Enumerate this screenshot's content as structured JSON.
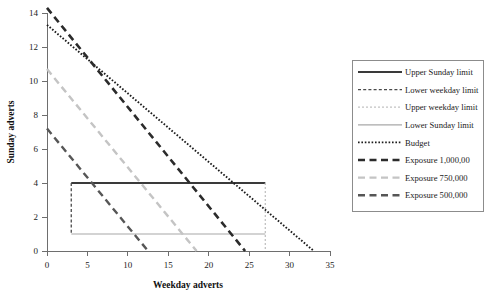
{
  "chart_data": {
    "type": "line",
    "title": "",
    "xlabel": "Weekday adverts",
    "ylabel": "Sunday adverts",
    "xlim": [
      0,
      35
    ],
    "ylim": [
      0,
      14
    ],
    "xticks": [
      0,
      5,
      10,
      15,
      20,
      25,
      30,
      35
    ],
    "yticks": [
      0,
      2,
      4,
      6,
      8,
      10,
      12,
      14
    ],
    "xtick_labels": [
      "0",
      "5",
      "10",
      "15",
      "20",
      "25",
      "30",
      "35"
    ],
    "ytick_labels": [
      "0",
      "2",
      "4",
      "6",
      "8",
      "10",
      "12",
      "14"
    ],
    "grid": false,
    "legend_position": "right",
    "series": [
      {
        "name": "Upper Sunday limit",
        "style": "solid-thick-dark",
        "color": "#3a3a3a",
        "width": 2.2,
        "dash": "none",
        "points": [
          [
            3,
            4
          ],
          [
            27,
            4
          ]
        ]
      },
      {
        "name": "Lower weekday limit",
        "style": "dashed-dark",
        "color": "#4a4a4a",
        "width": 1.3,
        "dash": "3,2.2",
        "points": [
          [
            3,
            4
          ],
          [
            3,
            1
          ]
        ]
      },
      {
        "name": "Upper weekday limit",
        "style": "dotted-light",
        "color": "#c2c2c2",
        "width": 1.3,
        "dash": "2,2",
        "points": [
          [
            27,
            4
          ],
          [
            27,
            0
          ]
        ]
      },
      {
        "name": "Lower Sunday limit",
        "style": "solid-light",
        "color": "#a8a8a8",
        "width": 1.2,
        "dash": "none",
        "points": [
          [
            3,
            1
          ],
          [
            27,
            1
          ]
        ]
      },
      {
        "name": "Budget",
        "style": "dotted-dark",
        "color": "#1c1c1c",
        "width": 1.9,
        "dash": "1.6,1.8",
        "points": [
          [
            0,
            13.3
          ],
          [
            33,
            0
          ]
        ]
      },
      {
        "name": "Exposure 1,000,00",
        "style": "dash-thick-dark",
        "color": "#2b2b2b",
        "width": 2.6,
        "dash": "7,4.5",
        "points": [
          [
            0,
            14.3
          ],
          [
            24.5,
            0
          ]
        ]
      },
      {
        "name": "Exposure 750,000",
        "style": "dash-light",
        "color": "#c4c4c4",
        "width": 2.4,
        "dash": "7,4.5",
        "points": [
          [
            0,
            10.7
          ],
          [
            18.5,
            0
          ]
        ]
      },
      {
        "name": "Exposure 500,000",
        "style": "dash-mid-dark",
        "color": "#565656",
        "width": 2.4,
        "dash": "7,4.5",
        "points": [
          [
            0,
            7.2
          ],
          [
            12.5,
            0
          ]
        ]
      }
    ],
    "annotations": []
  },
  "legend": {
    "entries": [
      {
        "label": "Upper Sunday limit"
      },
      {
        "label": "Lower weekday limit"
      },
      {
        "label": "Upper weekday limit"
      },
      {
        "label": "Lower Sunday limit"
      },
      {
        "label": "Budget"
      },
      {
        "label": "Exposure 1,000,00"
      },
      {
        "label": "Exposure 750,000"
      },
      {
        "label": "Exposure 500,000"
      }
    ]
  },
  "colors": {
    "axis": "#6e6e6e",
    "text": "#1a1a1a",
    "legend_border": "#8c8c8c",
    "background": "#ffffff"
  }
}
